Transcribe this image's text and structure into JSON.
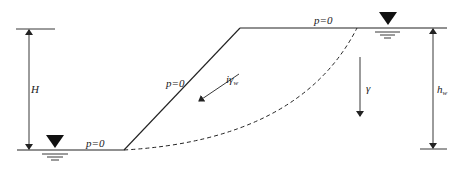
{
  "diagram": {
    "labels": {
      "H": "H",
      "hw_main": "h",
      "hw_sub": "w",
      "gamma": "γ",
      "seepage_main": "iγ",
      "seepage_sub": "w",
      "p_top": "p=0",
      "p_slope": "p=0",
      "p_toe": "p=0"
    },
    "icons": {
      "water_table_left": "water-level-icon",
      "water_table_right": "water-level-icon"
    },
    "colors": {
      "line": "#222222",
      "background": "#ffffff"
    }
  }
}
